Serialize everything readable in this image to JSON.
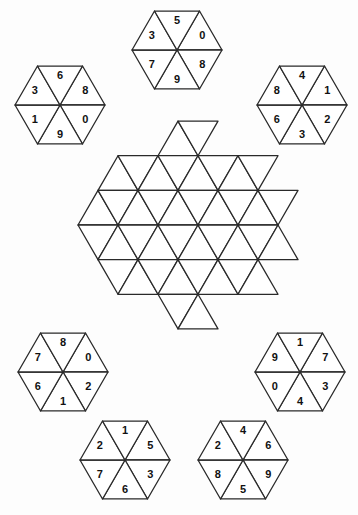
{
  "puzzle": {
    "title": "Hexagon Number Tile Puzzle",
    "background_color": "#fdfdfd",
    "line_color": "#2a2a2a",
    "text_color": "#111111",
    "piece_count": 7,
    "board": {
      "name": "hexagram-board",
      "shape": "hexagram",
      "filled": false,
      "triangle_count": 42,
      "description": "Empty six-pointed star board made of equilateral triangles"
    },
    "pieces": [
      {
        "id": "piece-top-center",
        "position": "top-center",
        "cx": 177,
        "cy": 50,
        "labels": {
          "top_left": "5",
          "top_right": "0",
          "right": "8",
          "bottom_right": "9",
          "bottom_left": "7",
          "left": "3"
        },
        "sequence": [
          "0",
          "8",
          "9",
          "7",
          "3",
          "5"
        ]
      },
      {
        "id": "piece-top-left",
        "position": "top-left",
        "cx": 60,
        "cy": 105,
        "labels": {
          "top_left": "6",
          "top_right": "8",
          "right": "0",
          "bottom_right": "9",
          "bottom_left": "1",
          "left": "3"
        },
        "sequence": [
          "8",
          "0",
          "9",
          "1",
          "3",
          "6"
        ]
      },
      {
        "id": "piece-top-right",
        "position": "top-right",
        "cx": 302,
        "cy": 105,
        "labels": {
          "top_left": "4",
          "top_right": "1",
          "right": "2",
          "bottom_right": "3",
          "bottom_left": "6",
          "left": "8"
        },
        "sequence": [
          "1",
          "2",
          "3",
          "6",
          "8",
          "4"
        ]
      },
      {
        "id": "piece-bottom-left",
        "position": "bottom-left",
        "cx": 63,
        "cy": 372,
        "labels": {
          "top_left": "8",
          "top_right": "0",
          "right": "2",
          "bottom_right": "1",
          "bottom_left": "6",
          "left": "7"
        },
        "sequence": [
          "0",
          "2",
          "1",
          "6",
          "7",
          "8"
        ]
      },
      {
        "id": "piece-bottom-right",
        "position": "bottom-right",
        "cx": 300,
        "cy": 372,
        "labels": {
          "top_left": "1",
          "top_right": "7",
          "right": "3",
          "bottom_right": "4",
          "bottom_left": "0",
          "left": "9"
        },
        "sequence": [
          "7",
          "3",
          "4",
          "0",
          "9",
          "1"
        ]
      },
      {
        "id": "piece-bottom-center-left",
        "position": "bottom-center-left",
        "cx": 125,
        "cy": 460,
        "labels": {
          "top_left": "1",
          "top_right": "5",
          "right": "3",
          "bottom_right": "6",
          "bottom_left": "7",
          "left": "2"
        },
        "sequence": [
          "5",
          "3",
          "6",
          "7",
          "2",
          "1"
        ]
      },
      {
        "id": "piece-bottom-center-right",
        "position": "bottom-center-right",
        "cx": 243,
        "cy": 460,
        "labels": {
          "top_left": "4",
          "top_right": "6",
          "right": "9",
          "bottom_right": "5",
          "bottom_left": "8",
          "left": "2"
        },
        "sequence": [
          "6",
          "9",
          "5",
          "8",
          "2",
          "4"
        ]
      }
    ]
  }
}
